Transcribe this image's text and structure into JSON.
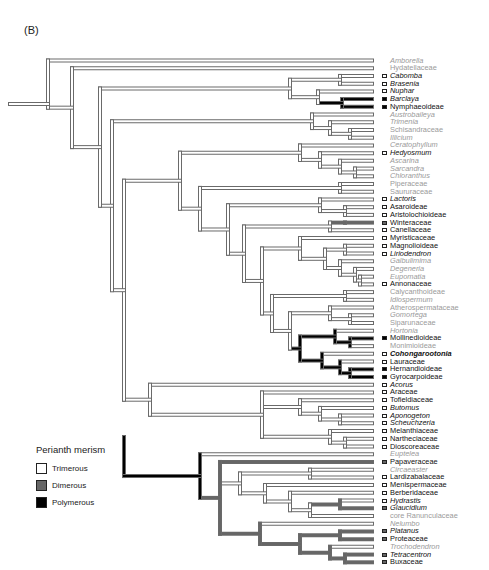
{
  "panel_label": "(B)",
  "legend": {
    "title": "Perianth merism",
    "items": [
      {
        "label": "Trimerous",
        "color": "#ffffff"
      },
      {
        "label": "Dimerous",
        "color": "#666666"
      },
      {
        "label": "Polymerous",
        "color": "#000000"
      }
    ]
  },
  "colors": {
    "trimerous": "#ffffff",
    "dimerous": "#666666",
    "polymerous": "#000000",
    "unknown_label": "#9a9a9a",
    "branch_outline": "#6a6a6a"
  },
  "tips": [
    {
      "name": "Amborella",
      "state": "none",
      "style": "grey ital"
    },
    {
      "name": "Hydatellaceae",
      "state": "none",
      "style": "grey"
    },
    {
      "name": "Cabomba",
      "state": "tri",
      "style": "ital"
    },
    {
      "name": "Brasenia",
      "state": "tri",
      "style": "ital"
    },
    {
      "name": "Nuphar",
      "state": "tri",
      "style": "ital"
    },
    {
      "name": "Barclaya",
      "state": "poly",
      "style": "ital"
    },
    {
      "name": "Nymphaeoideae",
      "state": "poly",
      "style": ""
    },
    {
      "name": "Austrobaileya",
      "state": "none",
      "style": "grey ital"
    },
    {
      "name": "Trimenia",
      "state": "none",
      "style": "grey ital"
    },
    {
      "name": "Schisandraceae",
      "state": "none",
      "style": "grey"
    },
    {
      "name": "Illicium",
      "state": "none",
      "style": "grey ital"
    },
    {
      "name": "Ceratophyllum",
      "state": "none",
      "style": "grey ital"
    },
    {
      "name": "Hedyosmum",
      "state": "tri",
      "style": "ital"
    },
    {
      "name": "Ascarina",
      "state": "none",
      "style": "grey ital"
    },
    {
      "name": "Sarcandra",
      "state": "none",
      "style": "grey ital"
    },
    {
      "name": "Chloranthus",
      "state": "none",
      "style": "grey ital"
    },
    {
      "name": "Piperaceae",
      "state": "none",
      "style": "grey"
    },
    {
      "name": "Saururaceae",
      "state": "none",
      "style": "grey"
    },
    {
      "name": "Lactoris",
      "state": "tri",
      "style": "ital"
    },
    {
      "name": "Asaroideae",
      "state": "tri",
      "style": ""
    },
    {
      "name": "Aristolochioideae",
      "state": "tri",
      "style": ""
    },
    {
      "name": "Winteraceae",
      "state": "di",
      "style": ""
    },
    {
      "name": "Canellaceae",
      "state": "tri",
      "style": ""
    },
    {
      "name": "Myristicaceae",
      "state": "tri",
      "style": ""
    },
    {
      "name": "Magnolioideae",
      "state": "tri",
      "style": ""
    },
    {
      "name": "Liriodendron",
      "state": "tri",
      "style": "ital"
    },
    {
      "name": "Galbulimima",
      "state": "none",
      "style": "grey ital"
    },
    {
      "name": "Degeneria",
      "state": "none",
      "style": "grey ital"
    },
    {
      "name": "Eupomatia",
      "state": "none",
      "style": "grey ital"
    },
    {
      "name": "Annonaceae",
      "state": "tri",
      "style": ""
    },
    {
      "name": "Calycanthoideae",
      "state": "none",
      "style": "grey"
    },
    {
      "name": "Idiospermum",
      "state": "none",
      "style": "grey ital"
    },
    {
      "name": "Atherospermataceae",
      "state": "none",
      "style": "grey"
    },
    {
      "name": "Gomortega",
      "state": "none",
      "style": "grey ital"
    },
    {
      "name": "Siparunaceae",
      "state": "none",
      "style": "grey"
    },
    {
      "name": "Hortonia",
      "state": "none",
      "style": "grey ital"
    },
    {
      "name": "Mollinedioideae",
      "state": "poly",
      "style": ""
    },
    {
      "name": "Monimioideae",
      "state": "none",
      "style": "grey"
    },
    {
      "name": "Cohongarootonia",
      "state": "tri",
      "style": "ital bold"
    },
    {
      "name": "Lauraceae",
      "state": "tri",
      "style": ""
    },
    {
      "name": "Hernandioideae",
      "state": "poly",
      "style": ""
    },
    {
      "name": "Gyrocarpoideae",
      "state": "poly",
      "style": ""
    },
    {
      "name": "Acorus",
      "state": "tri",
      "style": "ital"
    },
    {
      "name": "Araceae",
      "state": "tri",
      "style": ""
    },
    {
      "name": "Tofieldiaceae",
      "state": "tri",
      "style": ""
    },
    {
      "name": "Butomus",
      "state": "tri",
      "style": "ital"
    },
    {
      "name": "Aponogeton",
      "state": "tri",
      "style": "ital"
    },
    {
      "name": "Scheuchzeria",
      "state": "tri",
      "style": "ital"
    },
    {
      "name": "Melanthiaceae",
      "state": "tri",
      "style": ""
    },
    {
      "name": "Nartheciaceae",
      "state": "tri",
      "style": ""
    },
    {
      "name": "Dioscoreaceae",
      "state": "tri",
      "style": ""
    },
    {
      "name": "Eupteleа",
      "state": "none",
      "style": "grey ital"
    },
    {
      "name": "Papaveraceae",
      "state": "di",
      "style": ""
    },
    {
      "name": "Circaeaster",
      "state": "none",
      "style": "grey ital"
    },
    {
      "name": "Lardizabalaceae",
      "state": "tri",
      "style": ""
    },
    {
      "name": "Menispermaceae",
      "state": "tri",
      "style": ""
    },
    {
      "name": "Berberidaceae",
      "state": "tri",
      "style": ""
    },
    {
      "name": "Hydrastis",
      "state": "tri",
      "style": "ital"
    },
    {
      "name": "Glaucidium",
      "state": "di",
      "style": "ital"
    },
    {
      "name": "core Ranunculaceae",
      "state": "none",
      "style": "grey"
    },
    {
      "name": "Nelumbo",
      "state": "none",
      "style": "grey ital"
    },
    {
      "name": "Platanus",
      "state": "di",
      "style": "ital"
    },
    {
      "name": "Proteaceae",
      "state": "di",
      "style": ""
    },
    {
      "name": "Trochodendron",
      "state": "none",
      "style": "grey ital"
    },
    {
      "name": "Tetracentron",
      "state": "di",
      "style": "ital"
    },
    {
      "name": "Buxaceae",
      "state": "di",
      "style": ""
    }
  ]
}
